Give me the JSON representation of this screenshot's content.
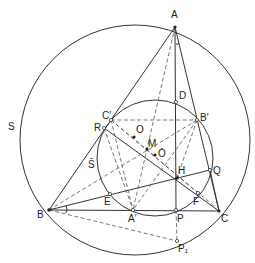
{
  "figure": {
    "type": "geometry-diagram",
    "circles": [
      {
        "name": "S",
        "label": "S",
        "cx": 135,
        "cy": 140,
        "r": 115
      },
      {
        "name": "S-bar",
        "label": "S̄",
        "cx": 155,
        "cy": 158,
        "r": 58
      }
    ],
    "points": [
      {
        "id": "A",
        "label": "A",
        "x": 175,
        "y": 27,
        "lx": 171,
        "ly": 18
      },
      {
        "id": "B",
        "label": "B",
        "x": 49,
        "y": 210,
        "lx": 37,
        "ly": 218
      },
      {
        "id": "C",
        "label": "C",
        "x": 219,
        "y": 211,
        "lx": 221,
        "ly": 222
      },
      {
        "id": "D",
        "label": "D",
        "x": 176,
        "y": 102,
        "lx": 179,
        "ly": 99
      },
      {
        "id": "B1",
        "label": "B′",
        "x": 197,
        "y": 120,
        "lx": 200,
        "ly": 121
      },
      {
        "id": "C1",
        "label": "C′",
        "x": 111,
        "y": 120,
        "lx": 102,
        "ly": 119
      },
      {
        "id": "R",
        "label": "R",
        "x": 104,
        "y": 128,
        "lx": 94,
        "ly": 131
      },
      {
        "id": "O",
        "label": "O",
        "x": 134,
        "y": 137,
        "lx": 136,
        "ly": 133
      },
      {
        "id": "M",
        "label": "M",
        "x": 147,
        "y": 149,
        "lx": 148,
        "ly": 147
      },
      {
        "id": "Obar",
        "label": "Ō",
        "x": 155,
        "y": 155,
        "lx": 158,
        "ly": 157
      },
      {
        "id": "H",
        "label": "H",
        "x": 177,
        "y": 178,
        "lx": 178,
        "ly": 174
      },
      {
        "id": "Q",
        "label": "Q",
        "x": 210,
        "y": 170,
        "lx": 213,
        "ly": 174
      },
      {
        "id": "E",
        "label": "E",
        "x": 110,
        "y": 194,
        "lx": 104,
        "ly": 205
      },
      {
        "id": "F",
        "label": "F",
        "x": 198,
        "y": 193,
        "lx": 193,
        "ly": 205
      },
      {
        "id": "A1",
        "label": "A′",
        "x": 133,
        "y": 210,
        "lx": 128,
        "ly": 222
      },
      {
        "id": "P",
        "label": "P",
        "x": 176,
        "y": 210,
        "lx": 177,
        "ly": 222
      },
      {
        "id": "P1",
        "label": "P₁",
        "x": 177,
        "y": 241,
        "lx": 178,
        "ly": 252
      }
    ],
    "angle_marks": [
      {
        "at": "A",
        "label": "angle-mark-A"
      },
      {
        "at": "B",
        "label": "angle-mark-B"
      }
    ],
    "labels": {
      "S_label": "S",
      "Sbar_label": "S̄"
    }
  }
}
